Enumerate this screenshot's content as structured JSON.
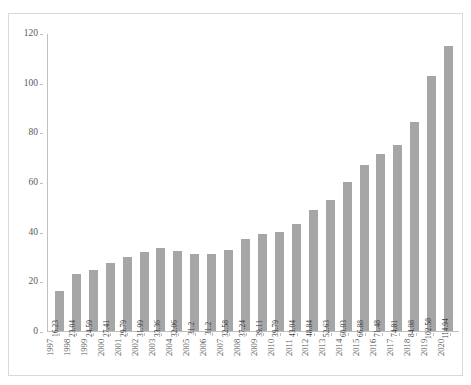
{
  "chart_data": {
    "type": "bar",
    "title": "",
    "subtitle": "",
    "xlabel": "",
    "ylabel": "",
    "ylim": [
      0,
      120
    ],
    "y_ticks": [
      0,
      20,
      40,
      60,
      80,
      100,
      120
    ],
    "grid": false,
    "legend": null,
    "bar_color": "#a6a6a6",
    "axis_color": "#bfbfbf",
    "border_color": "#d9d9d9",
    "label_color": "#595959",
    "categories": [
      "1997",
      "1998",
      "1999",
      "2000",
      "2001",
      "2002",
      "2003",
      "2004",
      "2005",
      "2006",
      "2007",
      "2008",
      "2009",
      "2010",
      "2011",
      "2012",
      "2013",
      "2014",
      "2015",
      "2016",
      "2017",
      "2018",
      "2019",
      "2020"
    ],
    "values": [
      16.23,
      23.04,
      24.59,
      27.41,
      29.79,
      31.99,
      33.36,
      32.06,
      31.2,
      31.2,
      32.58,
      37.24,
      39.11,
      39.79,
      43.04,
      48.84,
      52.63,
      60.03,
      66.88,
      71.48,
      74.81,
      84.08,
      102.58,
      114.94
    ],
    "value_labels": [
      "16.23",
      "23.04",
      "24.59",
      "27.41",
      "29.79",
      "31.99",
      "33.36",
      "32.06",
      "31.2",
      "31.2",
      "32.58",
      "37.24",
      "39.11",
      "39.79",
      "43.04",
      "48.84",
      "52.63",
      "60.03",
      "66.88",
      "71.48",
      "74.81",
      "84.08",
      "102.58",
      "114.94"
    ]
  }
}
